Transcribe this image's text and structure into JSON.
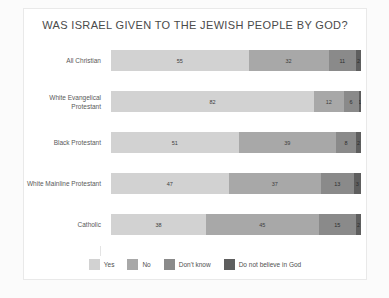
{
  "chart_data": {
    "type": "bar",
    "orientation": "horizontal",
    "stacked": true,
    "normalized_percent": true,
    "title": "WAS ISRAEL GIVEN TO THE JEWISH PEOPLE BY GOD?",
    "xlabel": "",
    "ylabel": "",
    "xlim": [
      0,
      100
    ],
    "grid": false,
    "legend_position": "bottom",
    "categories": [
      "All Christian",
      "White Evangelical Protestant",
      "Black Protestant",
      "White Mainline Protestant",
      "Catholic"
    ],
    "series": [
      {
        "name": "Yes",
        "color": "#d2d2d2",
        "values": [
          55,
          82,
          51,
          47,
          38
        ]
      },
      {
        "name": "No",
        "color": "#a8a8a8",
        "values": [
          32,
          12,
          39,
          37,
          45
        ]
      },
      {
        "name": "Don't know",
        "color": "#8a8a8a",
        "values": [
          11,
          6,
          8,
          13,
          15
        ]
      },
      {
        "name": "Do not believe in God",
        "color": "#5e5e5e",
        "values": [
          2,
          1,
          2,
          3,
          2
        ]
      }
    ]
  },
  "legend": {
    "items": [
      {
        "label": "Yes"
      },
      {
        "label": "No"
      },
      {
        "label": "Don't know"
      },
      {
        "label": "Do not believe in God"
      }
    ]
  }
}
